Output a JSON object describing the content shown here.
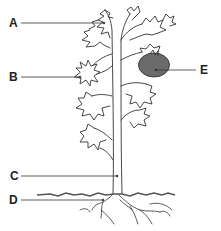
{
  "diagram": {
    "labels": [
      {
        "id": "A",
        "text": "A",
        "target": "top leaves"
      },
      {
        "id": "B",
        "text": "B",
        "target": "flower"
      },
      {
        "id": "C",
        "text": "C",
        "target": "stem"
      },
      {
        "id": "D",
        "text": "D",
        "target": "roots"
      },
      {
        "id": "E",
        "text": "E",
        "target": "fruit"
      }
    ],
    "colors": {
      "line": "#333333",
      "fruit": "#6b6b6b",
      "ground": "#555555"
    }
  }
}
